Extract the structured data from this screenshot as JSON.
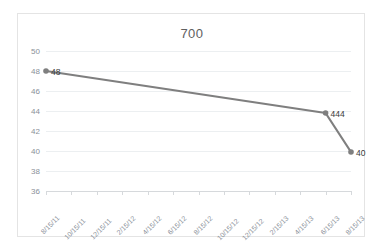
{
  "chart_data": {
    "type": "line",
    "title": "700",
    "xlabel": "",
    "ylabel": "",
    "ylim": [
      36,
      50
    ],
    "ytick_step": 2,
    "yticks": [
      "50",
      "48",
      "46",
      "44",
      "42",
      "40",
      "38",
      "36"
    ],
    "grid": true,
    "legend": "none",
    "line_color": "#7f7f7f",
    "marker_color": "#7f7f7f",
    "categories": [
      "8/15/11",
      "10/15/11",
      "12/15/11",
      "2/15/12",
      "4/15/12",
      "6/15/12",
      "8/15/12",
      "10/15/12",
      "12/15/12",
      "2/15/13",
      "4/15/13",
      "6/15/13",
      "8/15/13"
    ],
    "points": [
      {
        "x": "8/15/11",
        "y": 48,
        "label": "48"
      },
      {
        "x": "6/15/13",
        "y": 43.8,
        "label": "444"
      },
      {
        "x": "8/15/13",
        "y": 39.9,
        "label": "40"
      }
    ],
    "values": [
      48,
      null,
      null,
      null,
      null,
      null,
      null,
      null,
      null,
      null,
      null,
      43.8,
      39.9
    ]
  }
}
